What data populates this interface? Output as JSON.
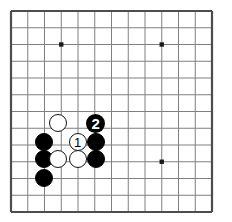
{
  "diagram": {
    "kind": "go-board-diagram",
    "board": {
      "lines": 13,
      "origin_x": 11,
      "origin_y": 11,
      "spacing": 16.75,
      "line_color": "#808080",
      "border_color": "#4d4d4d",
      "background_color": "#ffffff",
      "border_width": 2.2,
      "line_width": 1,
      "star_radius": 2.2,
      "star_color": "#1a1a1a",
      "star_points": [
        {
          "col": 3,
          "row": 2,
          "name": "star-point-upper-left"
        },
        {
          "col": 9,
          "row": 2,
          "name": "star-point-upper-right"
        },
        {
          "col": 9,
          "row": 9,
          "name": "star-point-lower-right"
        }
      ]
    },
    "stone_radius": 9,
    "stones": [
      {
        "id": "white-upper",
        "color": "white",
        "col": 2.82,
        "row": 6.67,
        "label": "",
        "name": "white-stone-upper"
      },
      {
        "id": "black-left-upper",
        "color": "black",
        "col": 1.97,
        "row": 7.8,
        "label": "",
        "name": "black-stone-left-upper"
      },
      {
        "id": "white-move-1",
        "color": "white",
        "col": 3.98,
        "row": 7.84,
        "label": "1",
        "name": "white-stone-move-1"
      },
      {
        "id": "black-left-lower",
        "color": "black",
        "col": 1.97,
        "row": 8.86,
        "label": "",
        "name": "black-stone-left-lower"
      },
      {
        "id": "white-lower-left",
        "color": "white",
        "col": 2.82,
        "row": 8.86,
        "label": "",
        "name": "white-stone-lower-left"
      },
      {
        "id": "white-lower-right",
        "color": "white",
        "col": 3.98,
        "row": 8.86,
        "label": "",
        "name": "white-stone-lower-right"
      },
      {
        "id": "black-right-upper",
        "color": "black",
        "col": 5.05,
        "row": 7.8,
        "label": "",
        "name": "black-stone-right-upper"
      },
      {
        "id": "black-right-lower",
        "color": "black",
        "col": 5.05,
        "row": 8.86,
        "label": "",
        "name": "black-stone-right-lower"
      },
      {
        "id": "black-bottom",
        "color": "black",
        "col": 1.97,
        "row": 9.95,
        "label": "",
        "name": "black-stone-bottom"
      }
    ],
    "move_markers": [
      {
        "id": "black-move-2",
        "label": "2",
        "col": 5.05,
        "row": 6.71,
        "radius": 9.5,
        "name": "move-marker-2"
      }
    ],
    "labels": {
      "move_one": "1",
      "move_two": "2"
    }
  }
}
